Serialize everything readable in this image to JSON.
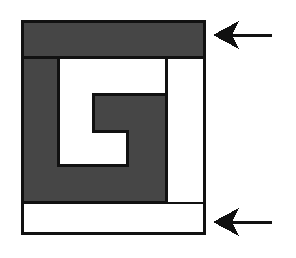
{
  "figure": {
    "name": "spiral-square-figure",
    "canvas": {
      "width": 296,
      "height": 258,
      "background": "#ffffff"
    },
    "colors": {
      "fill_dark": "#464646",
      "fill_light": "#ffffff",
      "outline": "#111111",
      "arrow": "#111111"
    },
    "outer_box": {
      "x": 22,
      "y": 21,
      "width": 182,
      "height": 212
    },
    "regions": [
      {
        "id": "top-band",
        "label": "top dark band",
        "shade": "dark",
        "x": 22,
        "y": 21,
        "width": 182,
        "height": 36
      },
      {
        "id": "spiral-arm",
        "label": "dark spiral arm",
        "shade": "dark",
        "points": "22,57 58,57 58,131 93,131 93,94 166,94 166,202 22,202"
      },
      {
        "id": "inner-light-arm",
        "label": "white spiral channel",
        "shade": "light",
        "points": "58,57 166,57 166,94 93,94 93,131 127,131 127,165 58,165"
      },
      {
        "id": "right-light-column",
        "label": "right white column",
        "shade": "light",
        "x": 166,
        "y": 57,
        "width": 38,
        "height": 145
      },
      {
        "id": "bottom-band",
        "label": "bottom white band",
        "shade": "light",
        "x": 22,
        "y": 202,
        "width": 182,
        "height": 31
      }
    ],
    "arrows": [
      {
        "id": "arrow-top",
        "label": "pointer to top dark band",
        "tip_x": 213,
        "tip_y": 35,
        "tail_x": 272,
        "tail_y": 35,
        "head_length": 26,
        "head_half_height": 14,
        "shaft_thickness": 3
      },
      {
        "id": "arrow-bottom",
        "label": "pointer to bottom white band",
        "tip_x": 213,
        "tip_y": 222,
        "tail_x": 272,
        "tail_y": 222,
        "head_length": 26,
        "head_half_height": 14,
        "shaft_thickness": 3
      }
    ]
  }
}
